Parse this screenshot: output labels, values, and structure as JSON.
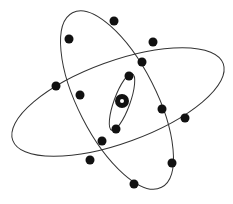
{
  "diagram": {
    "stroke_color": "#333333",
    "electron_color": "#111111",
    "nucleus": {
      "cx": 122,
      "cy": 101,
      "r": 7,
      "inner_r": 2,
      "inner_color": "#ffffff"
    },
    "orbits": [
      {
        "name": "wide-orbit",
        "cx": 118,
        "cy": 102,
        "rx": 112,
        "ry": 41,
        "rotate": -20
      },
      {
        "name": "tall-orbit",
        "cx": 117,
        "cy": 100,
        "rx": 39,
        "ry": 98,
        "rotate": -27
      },
      {
        "name": "inner-orbit",
        "cx": 122,
        "cy": 102,
        "rx": 8,
        "ry": 30,
        "rotate": 20
      }
    ],
    "electrons": [
      {
        "x": 114,
        "y": 21
      },
      {
        "x": 69,
        "y": 39
      },
      {
        "x": 153,
        "y": 42
      },
      {
        "x": 142,
        "y": 62
      },
      {
        "x": 129,
        "y": 76
      },
      {
        "x": 56,
        "y": 86
      },
      {
        "x": 80,
        "y": 95
      },
      {
        "x": 162,
        "y": 109
      },
      {
        "x": 185,
        "y": 118
      },
      {
        "x": 116,
        "y": 129
      },
      {
        "x": 102,
        "y": 141
      },
      {
        "x": 90,
        "y": 160
      },
      {
        "x": 172,
        "y": 163
      },
      {
        "x": 134,
        "y": 184
      }
    ],
    "electron_r": 4.5
  }
}
